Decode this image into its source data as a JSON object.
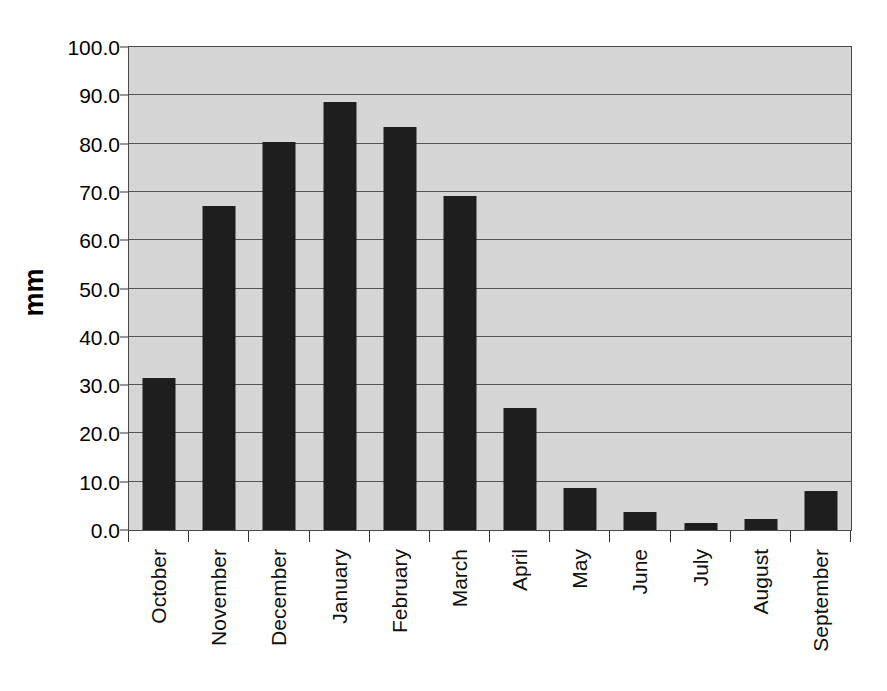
{
  "chart_data": {
    "type": "bar",
    "title": "",
    "subtitle": "",
    "xlabel": "",
    "ylabel": "mm",
    "ylim": [
      0.0,
      100.0
    ],
    "ytick_step": 10.0,
    "ytick_labels": [
      "100.0",
      "90.0",
      "80.0",
      "70.0",
      "60.0",
      "50.0",
      "40.0",
      "30.0",
      "20.0",
      "10.0",
      "0.0"
    ],
    "ytick_values": [
      100.0,
      90.0,
      80.0,
      70.0,
      60.0,
      50.0,
      40.0,
      30.0,
      20.0,
      10.0,
      0.0
    ],
    "grid": true,
    "legend": "none",
    "categories": [
      "October",
      "November",
      "December",
      "January",
      "February",
      "March",
      "April",
      "May",
      "June",
      "July",
      "August",
      "September"
    ],
    "values": [
      31.5,
      67.0,
      80.4,
      88.7,
      83.4,
      69.2,
      25.2,
      8.8,
      3.7,
      1.5,
      2.2,
      8.0
    ],
    "bar_color": "#1e1e1e",
    "plot_background": "#d6d6d6",
    "page_background": "#ffffff",
    "axis_color": "#4a4a4a",
    "gridline_color": "#555555",
    "xlabel_rotation": "-90"
  }
}
